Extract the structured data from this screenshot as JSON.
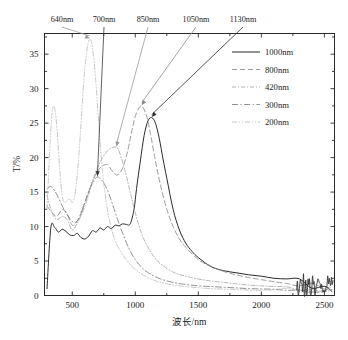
{
  "chart_data": {
    "type": "line",
    "title": "",
    "xlabel": "波长/nm",
    "ylabel": "T/%",
    "xlim": [
      280,
      2580
    ],
    "ylim": [
      0,
      38
    ],
    "xticks": [
      500,
      1000,
      1500,
      2000,
      2500
    ],
    "yticks": [
      0,
      5,
      10,
      15,
      20,
      25,
      30,
      35
    ],
    "xtick_labels": [
      "500",
      "1000",
      "1500",
      "2000",
      "2500"
    ],
    "ytick_labels": [
      "0",
      "5",
      "10",
      "15",
      "20",
      "25",
      "30",
      "35"
    ],
    "grid": false,
    "legend_position": "upper-right",
    "series": [
      {
        "name": "1000nm",
        "style": "solid",
        "color": "#2b2b2b",
        "peak_wavelength": 1130,
        "peak_value": 25.8,
        "x": [
          300,
          330,
          360,
          390,
          420,
          450,
          480,
          510,
          540,
          570,
          600,
          630,
          660,
          690,
          720,
          750,
          780,
          810,
          840,
          870,
          900,
          930,
          960,
          990,
          1010,
          1040,
          1070,
          1100,
          1130,
          1160,
          1190,
          1220,
          1250,
          1300,
          1350,
          1400,
          1450,
          1500,
          1600,
          1700,
          1800,
          1900,
          2000,
          2100,
          2200,
          2300,
          2400,
          2500,
          2560
        ],
        "y": [
          1.0,
          9.8,
          9.9,
          9.2,
          9.6,
          9.3,
          8.8,
          8.7,
          9.0,
          8.4,
          8.2,
          8.6,
          9.4,
          9.2,
          9.8,
          9.5,
          10.0,
          9.7,
          10.2,
          10.1,
          10.4,
          10.3,
          10.4,
          12.5,
          15.5,
          19.5,
          23.2,
          25.3,
          25.8,
          25.0,
          22.8,
          19.8,
          17.0,
          12.5,
          9.5,
          7.6,
          6.4,
          5.5,
          4.2,
          3.6,
          3.3,
          3.0,
          2.8,
          2.5,
          2.2,
          1.9,
          1.6,
          1.3,
          1.9
        ]
      },
      {
        "name": "800nm",
        "style": "dashed",
        "color": "#8a8a8a",
        "peak_wavelength": 1050,
        "peak_value": 27.5,
        "x": [
          300,
          340,
          380,
          420,
          460,
          500,
          540,
          580,
          620,
          660,
          700,
          740,
          780,
          800,
          830,
          860,
          900,
          940,
          980,
          1010,
          1050,
          1090,
          1120,
          1160,
          1200,
          1250,
          1300,
          1350,
          1400,
          1500,
          1600,
          1700,
          1800,
          1900,
          2000,
          2100,
          2200,
          2300,
          2400,
          2500,
          2560
        ],
        "y": [
          13.0,
          12.0,
          11.5,
          12.5,
          11.8,
          10.2,
          10.8,
          12.5,
          14.5,
          16.5,
          18.0,
          18.8,
          19.0,
          18.5,
          17.8,
          17.5,
          18.5,
          21.0,
          24.5,
          26.5,
          27.5,
          26.0,
          23.5,
          19.5,
          16.0,
          12.5,
          10.0,
          8.2,
          7.0,
          5.2,
          4.2,
          3.5,
          3.0,
          2.6,
          2.3,
          2.0,
          1.7,
          1.5,
          1.2,
          1.0,
          1.4
        ]
      },
      {
        "name": "420nm",
        "style": "dash-dot-fine",
        "color": "#a5a5a5",
        "peak_wavelength": 850,
        "peak_value": 21.5,
        "x": [
          300,
          340,
          380,
          420,
          460,
          500,
          540,
          580,
          620,
          660,
          700,
          740,
          780,
          810,
          850,
          880,
          920,
          960,
          1000,
          1050,
          1100,
          1150,
          1200,
          1300,
          1400,
          1500,
          1600,
          1700,
          1800,
          1900,
          2000,
          2100,
          2200,
          2300,
          2400,
          2500,
          2560
        ],
        "y": [
          14.5,
          12.0,
          11.0,
          11.5,
          11.0,
          9.5,
          10.5,
          12.0,
          14.0,
          16.5,
          18.5,
          20.0,
          21.0,
          21.4,
          21.5,
          20.5,
          18.0,
          15.0,
          12.0,
          9.0,
          7.0,
          5.6,
          4.6,
          3.4,
          2.8,
          2.4,
          2.1,
          1.9,
          1.7,
          1.5,
          1.4,
          1.3,
          1.2,
          1.1,
          1.0,
          0.9,
          1.1
        ]
      },
      {
        "name": "300nm",
        "style": "dash-dot",
        "color": "#7d7d7d",
        "peak_wavelength": 700,
        "peak_value": 17.2,
        "x": [
          300,
          330,
          360,
          390,
          420,
          450,
          480,
          510,
          540,
          570,
          600,
          640,
          670,
          700,
          730,
          760,
          790,
          820,
          860,
          900,
          950,
          1000,
          1060,
          1120,
          1200,
          1300,
          1400,
          1500,
          1600,
          1700,
          1800,
          1900,
          2000,
          2100,
          2200,
          2300,
          2400,
          2500,
          2560
        ],
        "y": [
          15.5,
          15.8,
          15.2,
          14.2,
          13.0,
          12.0,
          11.2,
          10.6,
          10.8,
          11.8,
          13.5,
          15.5,
          16.6,
          17.2,
          16.8,
          16.0,
          14.8,
          13.2,
          11.0,
          9.0,
          6.8,
          5.2,
          3.9,
          3.1,
          2.4,
          1.9,
          1.6,
          1.4,
          1.3,
          1.2,
          1.1,
          1.0,
          0.95,
          0.9,
          0.85,
          0.8,
          0.75,
          0.7,
          0.9
        ]
      },
      {
        "name": "200nm",
        "style": "dash-dot-dot",
        "color": "#bdbdbd",
        "peak_wavelength": 640,
        "peak_value": 37.0,
        "x": [
          300,
          320,
          340,
          360,
          380,
          400,
          420,
          440,
          460,
          480,
          500,
          520,
          545,
          570,
          595,
          620,
          640,
          660,
          685,
          710,
          740,
          770,
          800,
          840,
          880,
          920,
          970,
          1020,
          1080,
          1150,
          1250,
          1350,
          1450,
          1600,
          1750,
          1900,
          2050,
          2200,
          2350,
          2500,
          2560
        ],
        "y": [
          12.5,
          20.5,
          26.5,
          27.2,
          24.0,
          18.5,
          14.5,
          13.5,
          13.8,
          14.0,
          13.5,
          14.5,
          18.5,
          25.0,
          32.0,
          36.0,
          37.2,
          36.0,
          31.5,
          25.0,
          18.0,
          13.5,
          10.5,
          8.0,
          6.5,
          5.4,
          4.3,
          3.5,
          2.8,
          2.2,
          1.7,
          1.4,
          1.2,
          1.0,
          0.9,
          0.8,
          0.75,
          0.7,
          0.65,
          0.6,
          0.8
        ]
      }
    ],
    "annotations": [
      {
        "label": "640nm",
        "target_wavelength": 640,
        "target_value": 37.2,
        "series": "200nm"
      },
      {
        "label": "700nm",
        "target_wavelength": 700,
        "target_value": 17.2,
        "series": "300nm"
      },
      {
        "label": "850nm",
        "target_wavelength": 850,
        "target_value": 21.5,
        "series": "420nm"
      },
      {
        "label": "1050nm",
        "target_wavelength": 1050,
        "target_value": 27.5,
        "series": "800nm"
      },
      {
        "label": "1130nm",
        "target_wavelength": 1130,
        "target_value": 25.8,
        "series": "1000nm"
      }
    ]
  },
  "legend": {
    "items": [
      {
        "label": "1000nm"
      },
      {
        "label": "800nm"
      },
      {
        "label": "420nm"
      },
      {
        "label": "300nm"
      },
      {
        "label": "200nm"
      }
    ]
  },
  "caption": {
    "text": ""
  }
}
